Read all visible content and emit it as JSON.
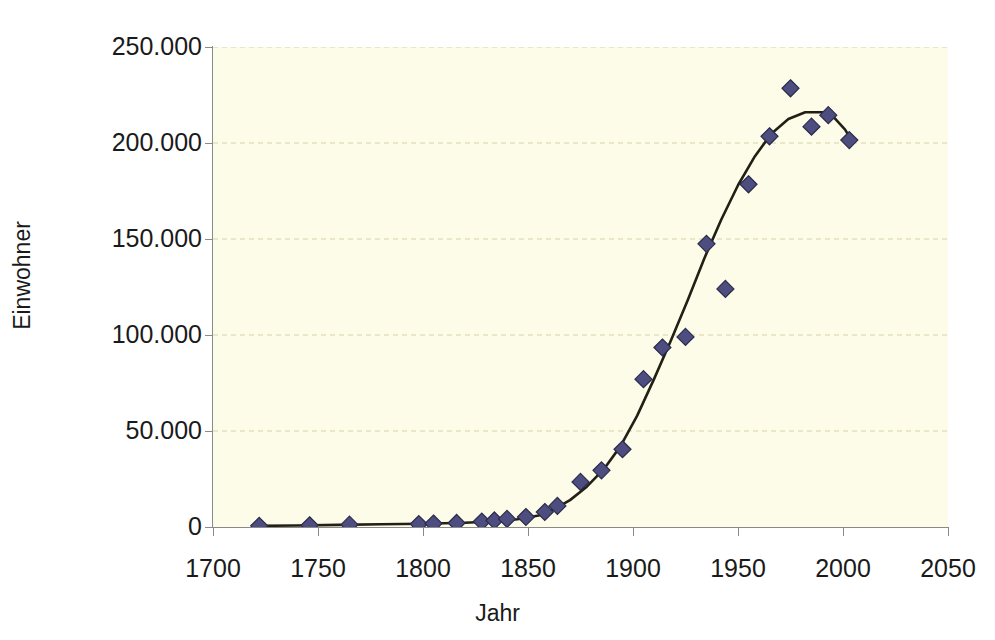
{
  "chart_data": {
    "type": "scatter",
    "title": "",
    "xlabel": "Jahr",
    "ylabel": "Einwohner",
    "xlim": [
      1700,
      2050
    ],
    "ylim": [
      0,
      250000
    ],
    "xticks": [
      1700,
      1750,
      1800,
      1850,
      1900,
      1950,
      2000,
      2050
    ],
    "xtick_labels": [
      "1700",
      "1750",
      "1800",
      "1850",
      "1900",
      "1950",
      "2000",
      "2050"
    ],
    "yticks": [
      0,
      50000,
      100000,
      150000,
      200000,
      250000
    ],
    "ytick_labels": [
      "0",
      "50.000",
      "100.000",
      "150.000",
      "200.000",
      "250.000"
    ],
    "grid": "horizontal-dashed",
    "legend": "none",
    "marker": "diamond",
    "marker_color": "#4d4d7f",
    "marker_edge_color": "#2b2b4d",
    "line_color": "#221f14",
    "plot_background": "#FDFCE8",
    "page_background": "#FFFFFF",
    "grid_color": "#d8d2a8",
    "axis_color": "#8a8a8a",
    "points": [
      {
        "x": 1722,
        "y": 600
      },
      {
        "x": 1746,
        "y": 900
      },
      {
        "x": 1765,
        "y": 1200
      },
      {
        "x": 1798,
        "y": 1500
      },
      {
        "x": 1805,
        "y": 1800
      },
      {
        "x": 1816,
        "y": 2100
      },
      {
        "x": 1828,
        "y": 2800
      },
      {
        "x": 1834,
        "y": 3400
      },
      {
        "x": 1840,
        "y": 4200
      },
      {
        "x": 1849,
        "y": 5200
      },
      {
        "x": 1858,
        "y": 7800
      },
      {
        "x": 1864,
        "y": 11000
      },
      {
        "x": 1875,
        "y": 23500
      },
      {
        "x": 1885,
        "y": 29500
      },
      {
        "x": 1895,
        "y": 40500
      },
      {
        "x": 1905,
        "y": 77000
      },
      {
        "x": 1914,
        "y": 93500
      },
      {
        "x": 1925,
        "y": 99000
      },
      {
        "x": 1935,
        "y": 147500
      },
      {
        "x": 1944,
        "y": 124000
      },
      {
        "x": 1955,
        "y": 178500
      },
      {
        "x": 1965,
        "y": 203500
      },
      {
        "x": 1975,
        "y": 228500
      },
      {
        "x": 1985,
        "y": 208500
      },
      {
        "x": 1993,
        "y": 214500
      },
      {
        "x": 2003,
        "y": 201500
      }
    ],
    "trend_line": [
      {
        "x": 1722,
        "y": 600
      },
      {
        "x": 1740,
        "y": 800
      },
      {
        "x": 1760,
        "y": 1100
      },
      {
        "x": 1780,
        "y": 1400
      },
      {
        "x": 1800,
        "y": 1700
      },
      {
        "x": 1820,
        "y": 2200
      },
      {
        "x": 1835,
        "y": 3000
      },
      {
        "x": 1845,
        "y": 4000
      },
      {
        "x": 1855,
        "y": 6000
      },
      {
        "x": 1862,
        "y": 9000
      },
      {
        "x": 1870,
        "y": 14000
      },
      {
        "x": 1878,
        "y": 21000
      },
      {
        "x": 1886,
        "y": 30000
      },
      {
        "x": 1894,
        "y": 42000
      },
      {
        "x": 1902,
        "y": 58000
      },
      {
        "x": 1910,
        "y": 77000
      },
      {
        "x": 1918,
        "y": 97000
      },
      {
        "x": 1926,
        "y": 118000
      },
      {
        "x": 1934,
        "y": 140000
      },
      {
        "x": 1942,
        "y": 160000
      },
      {
        "x": 1950,
        "y": 178000
      },
      {
        "x": 1958,
        "y": 193000
      },
      {
        "x": 1966,
        "y": 205000
      },
      {
        "x": 1974,
        "y": 212500
      },
      {
        "x": 1982,
        "y": 216000
      },
      {
        "x": 1990,
        "y": 216000
      },
      {
        "x": 1996,
        "y": 213000
      },
      {
        "x": 2001,
        "y": 207000
      },
      {
        "x": 2004,
        "y": 201500
      }
    ]
  },
  "axis": {
    "x_title": "Jahr",
    "y_title": "Einwohner"
  },
  "caption": {
    "cut_off_text": ""
  }
}
